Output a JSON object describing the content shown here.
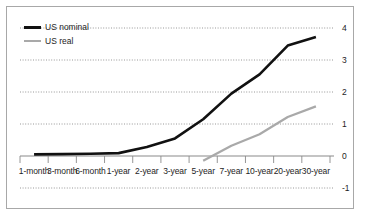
{
  "chart_data": {
    "type": "line",
    "title": "",
    "subtitle": "",
    "xlabel": "",
    "ylabel": "",
    "categories": [
      "1-month",
      "3-month",
      "6-month",
      "1-year",
      "2-year",
      "3-year",
      "5-year",
      "7-year",
      "10-year",
      "20-year",
      "30-year"
    ],
    "series": [
      {
        "name": "US nominal",
        "color": "#111111",
        "values": [
          0.05,
          0.06,
          0.07,
          0.09,
          0.28,
          0.55,
          1.15,
          1.95,
          2.55,
          3.45,
          3.72
        ],
        "start_category": "1-month"
      },
      {
        "name": "US real",
        "color": "#a9a9a9",
        "values": [
          null,
          null,
          null,
          null,
          null,
          null,
          -0.15,
          0.32,
          0.68,
          1.22,
          1.55
        ],
        "start_category": "5-year"
      }
    ],
    "ylim": [
      -1,
      4
    ],
    "yticks": [
      4,
      3,
      2,
      1,
      0,
      -1
    ],
    "ytick_labels": [
      "4",
      "3",
      "2",
      "1",
      "0",
      "-1"
    ],
    "grid": true,
    "grid_style": "dotted",
    "grid_color": "#8c8c8c",
    "zero_axis_color": "#8a8a8a",
    "legend_position": "top-left",
    "background": "#ffffff",
    "frame_color": "#a8a8a8"
  },
  "legend": {
    "items": [
      {
        "label": "US nominal",
        "color": "#111111"
      },
      {
        "label": "US real",
        "color": "#a9a9a9"
      }
    ]
  },
  "axes": {
    "y_labels": [
      "4",
      "3",
      "2",
      "1",
      "0",
      "-1"
    ],
    "x_labels": [
      "1-month",
      "3-month",
      "6-month",
      "1-year",
      "2-year",
      "3-year",
      "5-year",
      "7-year",
      "10-year",
      "20-year",
      "30-year"
    ]
  }
}
